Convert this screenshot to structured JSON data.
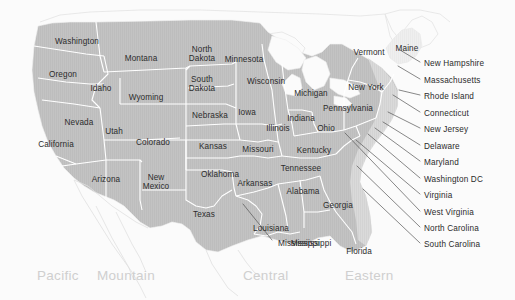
{
  "map": {
    "title": "United States Time Zones Map",
    "background_color": "#fbfbfb",
    "land_color": "#c3c3c3",
    "land_color_light": "#e2e2e2",
    "border_color": "#ffffff",
    "label_color": "#2c2c2c",
    "timezone_label_color": "#cfcfcf",
    "leader_line_color": "#555555"
  },
  "states": [
    {
      "name": "Washington",
      "x": 77,
      "y": 41,
      "lines": [
        "Washington"
      ]
    },
    {
      "name": "Oregon",
      "x": 63,
      "y": 74,
      "lines": [
        "Oregon"
      ]
    },
    {
      "name": "Montana",
      "x": 141,
      "y": 58,
      "lines": [
        "Montana"
      ]
    },
    {
      "name": "Idaho",
      "x": 101,
      "y": 88,
      "lines": [
        "Idaho"
      ]
    },
    {
      "name": "Wyoming",
      "x": 146,
      "y": 97,
      "lines": [
        "Wyoming"
      ]
    },
    {
      "name": "North Dakota",
      "x": 202,
      "y": 54,
      "lines": [
        "North",
        "Dakota"
      ]
    },
    {
      "name": "South Dakota",
      "x": 202,
      "y": 84,
      "lines": [
        "South",
        "Dakota"
      ]
    },
    {
      "name": "Minnesota",
      "x": 244,
      "y": 59,
      "lines": [
        "Minnesota"
      ]
    },
    {
      "name": "Wisconsin",
      "x": 266,
      "y": 81,
      "lines": [
        "Wisconsin"
      ]
    },
    {
      "name": "Nebraska",
      "x": 210,
      "y": 115,
      "lines": [
        "Nebraska"
      ]
    },
    {
      "name": "Iowa",
      "x": 247,
      "y": 112,
      "lines": [
        "Iowa"
      ]
    },
    {
      "name": "Michigan",
      "x": 311,
      "y": 93,
      "lines": [
        "Michigan"
      ]
    },
    {
      "name": "Nevada",
      "x": 79,
      "y": 122,
      "lines": [
        "Nevada"
      ]
    },
    {
      "name": "Utah",
      "x": 114,
      "y": 131,
      "lines": [
        "Utah"
      ]
    },
    {
      "name": "California",
      "x": 56,
      "y": 144,
      "lines": [
        "California"
      ]
    },
    {
      "name": "Colorado",
      "x": 153,
      "y": 142,
      "lines": [
        "Colorado"
      ]
    },
    {
      "name": "Kansas",
      "x": 213,
      "y": 146,
      "lines": [
        "Kansas"
      ]
    },
    {
      "name": "Missouri",
      "x": 258,
      "y": 149,
      "lines": [
        "Missouri"
      ]
    },
    {
      "name": "Illinois",
      "x": 278,
      "y": 128,
      "lines": [
        "Illinois"
      ]
    },
    {
      "name": "Indiana",
      "x": 301,
      "y": 118,
      "lines": [
        "Indiana"
      ]
    },
    {
      "name": "Ohio",
      "x": 326,
      "y": 128,
      "lines": [
        "Ohio"
      ]
    },
    {
      "name": "Pennsylvania",
      "x": 348,
      "y": 108,
      "lines": [
        "Pennsylvania"
      ]
    },
    {
      "name": "New York",
      "x": 366,
      "y": 87,
      "lines": [
        "New York"
      ]
    },
    {
      "name": "Vermont",
      "x": 369,
      "y": 52,
      "lines": [
        "Vermont"
      ]
    },
    {
      "name": "Maine",
      "x": 407,
      "y": 48,
      "lines": [
        "Maine"
      ]
    },
    {
      "name": "Kentucky",
      "x": 314,
      "y": 150,
      "lines": [
        "Kentucky"
      ]
    },
    {
      "name": "Tennessee",
      "x": 301,
      "y": 168,
      "lines": [
        "Tennessee"
      ]
    },
    {
      "name": "Arizona",
      "x": 106,
      "y": 179,
      "lines": [
        "Arizona"
      ]
    },
    {
      "name": "New Mexico",
      "x": 156,
      "y": 182,
      "lines": [
        "New",
        "Mexico"
      ]
    },
    {
      "name": "Oklahoma",
      "x": 220,
      "y": 174,
      "lines": [
        "Oklahoma"
      ]
    },
    {
      "name": "Arkansas",
      "x": 255,
      "y": 183,
      "lines": [
        "Arkansas"
      ]
    },
    {
      "name": "Alabama",
      "x": 303,
      "y": 191,
      "lines": [
        "Alabama"
      ]
    },
    {
      "name": "Georgia",
      "x": 338,
      "y": 205,
      "lines": [
        "Georgia"
      ]
    },
    {
      "name": "Texas",
      "x": 204,
      "y": 214,
      "lines": [
        "Texas"
      ]
    },
    {
      "name": "Louisiana",
      "x": 271,
      "y": 228,
      "lines": [
        "Louisiana"
      ]
    },
    {
      "name": "Mississippi",
      "x": 311,
      "y": 243,
      "lines": [
        "Mississippi"
      ]
    },
    {
      "name": "Florida",
      "x": 359,
      "y": 251,
      "lines": [
        "Florida"
      ]
    }
  ],
  "callouts": [
    {
      "name": "New Hampshire",
      "label": "New Hampshire",
      "x": 424,
      "y": 63,
      "line": [
        420,
        62,
        400,
        50
      ]
    },
    {
      "name": "Massachusetts",
      "label": "Massachusetts",
      "x": 424,
      "y": 80,
      "line": [
        420,
        79,
        398,
        66
      ]
    },
    {
      "name": "Rhode Island",
      "label": "Rhode Island",
      "x": 424,
      "y": 96,
      "line": [
        420,
        95,
        399,
        90
      ]
    },
    {
      "name": "Connecticut",
      "label": "Connecticut",
      "x": 424,
      "y": 113,
      "line": [
        420,
        112,
        393,
        95
      ]
    },
    {
      "name": "New Jersey",
      "label": "New Jersey",
      "x": 424,
      "y": 129,
      "line": [
        420,
        128,
        388,
        112
      ]
    },
    {
      "name": "Delaware",
      "label": "Delaware",
      "x": 424,
      "y": 146,
      "line": [
        420,
        145,
        383,
        122
      ]
    },
    {
      "name": "Maryland",
      "label": "Maryland",
      "x": 424,
      "y": 162,
      "line": [
        420,
        161,
        375,
        128
      ]
    },
    {
      "name": "Washington DC",
      "label": "Washington DC",
      "x": 424,
      "y": 179,
      "line": [
        420,
        178,
        368,
        134
      ]
    },
    {
      "name": "Virginia",
      "label": "Virginia",
      "x": 424,
      "y": 195,
      "line": [
        420,
        194,
        356,
        140
      ]
    },
    {
      "name": "West Virginia",
      "label": "West Virginia",
      "x": 424,
      "y": 212,
      "line": [
        420,
        211,
        345,
        133
      ]
    },
    {
      "name": "North Carolina",
      "label": "North Carolina",
      "x": 424,
      "y": 228,
      "line": [
        420,
        227,
        357,
        166
      ]
    },
    {
      "name": "South Carolina",
      "label": "South Carolina",
      "x": 424,
      "y": 244,
      "line": [
        420,
        243,
        363,
        189
      ]
    },
    {
      "name": "Mississippi",
      "label": "Mississippi",
      "x": 278,
      "y": 243,
      "line": [
        272,
        240,
        243,
        204
      ]
    }
  ],
  "timezones": [
    {
      "name": "Pacific",
      "label": "Pacific",
      "x": 37,
      "y": 275
    },
    {
      "name": "Mountain",
      "label": "Mountain",
      "x": 97,
      "y": 275
    },
    {
      "name": "Central",
      "label": "Central",
      "x": 243,
      "y": 275
    },
    {
      "name": "Eastern",
      "label": "Eastern",
      "x": 345,
      "y": 275
    }
  ]
}
